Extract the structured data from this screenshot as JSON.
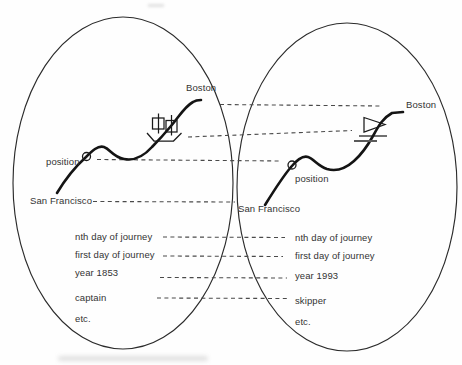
{
  "figure": {
    "kind": "analogy-mapping-diagram",
    "background_color": "#fefefe",
    "ink_color": "#1a1a1a",
    "text_color": "#333333",
    "dash_color": "#4a4a4a"
  },
  "source_domain": {
    "destination_city": "Boston",
    "position_label": "position",
    "origin_city": "San Francisco",
    "vehicle_icon": "square-rigged-ship-icon",
    "attributes": [
      "nth day of journey",
      "first day of journey",
      "year 1853",
      "captain",
      "etc."
    ]
  },
  "target_domain": {
    "destination_city": "Boston",
    "position_label": "position",
    "origin_city": "San Francisco",
    "vehicle_icon": "sailboat-icon",
    "attributes": [
      "nth day of journey",
      "first day of journey",
      "year 1993",
      "skipper",
      "etc."
    ]
  },
  "correspondence_lines": [
    "Boston - Boston",
    "ship - sailboat",
    "position - position",
    "San Francisco - San Francisco",
    "nth day of journey - nth day of journey",
    "first day of journey - first day of journey",
    "year 1853 - year 1993",
    "captain - skipper"
  ]
}
